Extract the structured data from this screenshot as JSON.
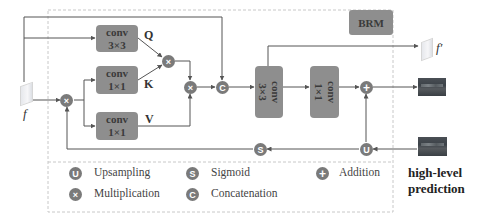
{
  "module": {
    "title": "BRM",
    "input_label": "f",
    "output_feature_label": "f′",
    "high_level_label_line1": "high-level",
    "high_level_label_line2": "prediction"
  },
  "blocks": {
    "conv_q": {
      "line1": "conv",
      "line2": "3×3",
      "branch": "Q"
    },
    "conv_k": {
      "line1": "conv",
      "line2": "1×1",
      "branch": "K"
    },
    "conv_v": {
      "line1": "conv",
      "line2": "1×1",
      "branch": "V"
    },
    "conv_fuse": {
      "line1": "conv",
      "line2": "3×3"
    },
    "conv_out": {
      "line1": "conv",
      "line2": "1×1"
    }
  },
  "operators": {
    "multiply": "×",
    "concat": "C",
    "add": "+",
    "upsample": "U",
    "sigmoid": "S"
  },
  "legend": [
    {
      "symbol": "U",
      "label": "Upsampling"
    },
    {
      "symbol": "S",
      "label": "Sigmoid"
    },
    {
      "symbol": "+",
      "label": "Addition"
    },
    {
      "symbol": "×",
      "label": "Multiplication"
    },
    {
      "symbol": "C",
      "label": "Concatenation"
    }
  ],
  "colors": {
    "block_fill": "#8e8e8e",
    "operator_fill": "#7a7a7a",
    "line": "#555555",
    "dashed_border": "#c8c8c8"
  }
}
